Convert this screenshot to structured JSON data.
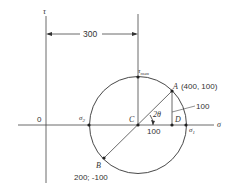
{
  "diagram": {
    "axes": {
      "vertical_label": "τ",
      "horizontal_label": "σ",
      "origin_label": "0"
    },
    "dimension": {
      "label": "300"
    },
    "points": {
      "tau_max": {
        "label": "τ",
        "subscript": "max"
      },
      "A": {
        "label": "A",
        "coords": "(400, 100)"
      },
      "B": {
        "label": "B",
        "coords": "200; -100"
      },
      "C": {
        "label": "C"
      },
      "D": {
        "label": "D"
      },
      "sigma1": {
        "label": "σ",
        "subscript": "1"
      },
      "sigma2": {
        "label": "σ",
        "subscript": "2"
      }
    },
    "angle_label": "2θ",
    "segment_labels": {
      "CD": "100",
      "AD": "100"
    },
    "colors": {
      "line": "#333333",
      "background": "#ffffff"
    }
  }
}
